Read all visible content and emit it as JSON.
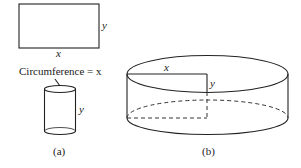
{
  "figure": {
    "panel_a": {
      "label": "(a)",
      "rectangle": {
        "width_label": "x",
        "height_label": "y"
      },
      "caption_text": "Circumference = x",
      "cylinder": {
        "height_label": "y"
      }
    },
    "panel_b": {
      "label": "(b)",
      "cylinder": {
        "radius_label": "x",
        "height_label": "y"
      }
    }
  },
  "colors": {
    "line": "#222222",
    "background": "#ffffff"
  }
}
